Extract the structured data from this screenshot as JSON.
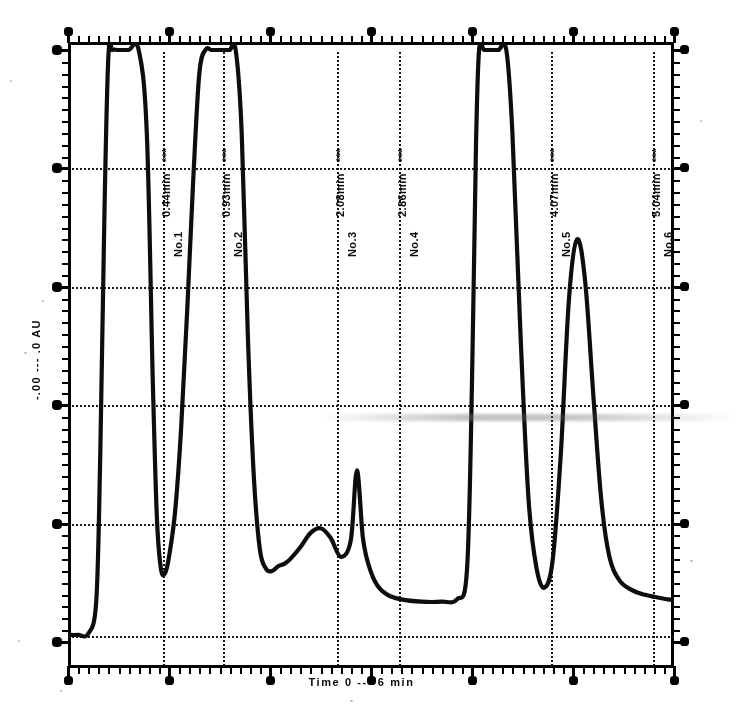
{
  "figure": {
    "title": "",
    "xlabel": "Time  0  ---  6 min",
    "ylabel": "-.00 --- .0 AU"
  },
  "axes": {
    "x_major_ticks": [
      "0",
      "1",
      "2",
      "3",
      "4",
      "5",
      "6"
    ],
    "y_major_ticks": [
      "5",
      "4",
      "3",
      "2",
      "1",
      "0"
    ],
    "grid": "horizontal-dotted",
    "frame": "box"
  },
  "annotations": [
    {
      "no": "No.1",
      "time": "0.44min",
      "extra": "***",
      "x_px": 95,
      "label_x_px": 98
    },
    {
      "no": "No.2",
      "time": "0.93min",
      "extra": "***",
      "x_px": 155,
      "label_x_px": 158
    },
    {
      "no": "No.3",
      "time": "2.08min",
      "extra": "***",
      "x_px": 269,
      "label_x_px": 272
    },
    {
      "no": "No.4",
      "time": "2.86min",
      "extra": "***",
      "x_px": 331,
      "label_x_px": 334
    },
    {
      "no": "No.5",
      "time": "4.07min",
      "extra": "***",
      "x_px": 483,
      "label_x_px": 486
    },
    {
      "no": "No.6",
      "time": "5.04min",
      "extra": "***",
      "x_px": 585,
      "label_x_px": 588
    }
  ],
  "chart_data": {
    "type": "line",
    "title": "",
    "xlabel": "Time  0  ---  6 min",
    "ylabel": "-.00 --- .0 AU",
    "xlim": [
      0,
      6
    ],
    "ylim": [
      0,
      5
    ],
    "grid": true,
    "legend": "none",
    "series": [
      {
        "name": "detector-response",
        "x": [
          0.0,
          0.1,
          0.2,
          0.28,
          0.32,
          0.36,
          0.4,
          0.44,
          0.5,
          0.6,
          0.7,
          0.78,
          0.84,
          0.88,
          0.92,
          0.96,
          1.0,
          1.06,
          1.12,
          1.18,
          1.24,
          1.3,
          1.36,
          1.42,
          1.48,
          1.54,
          1.6,
          1.66,
          1.72,
          1.78,
          1.84,
          1.9,
          1.96,
          2.02,
          2.08,
          2.14,
          2.2,
          2.3,
          2.4,
          2.5,
          2.6,
          2.7,
          2.8,
          2.86,
          2.92,
          2.98,
          3.06,
          3.16,
          3.3,
          3.5,
          3.7,
          3.85,
          3.95,
          4.0,
          4.04,
          4.07,
          4.12,
          4.18,
          4.26,
          4.34,
          4.4,
          4.48,
          4.56,
          4.64,
          4.72,
          4.8,
          4.88,
          4.96,
          5.04,
          5.12,
          5.2,
          5.28,
          5.36,
          5.46,
          5.58,
          5.7,
          5.82,
          5.94,
          6.0
        ],
        "y": [
          0.06,
          0.06,
          0.07,
          0.35,
          1.6,
          3.6,
          4.95,
          5.0,
          5.0,
          5.0,
          5.0,
          4.3,
          2.2,
          1.05,
          0.62,
          0.58,
          0.72,
          1.1,
          1.8,
          2.8,
          3.9,
          4.8,
          5.0,
          5.0,
          5.0,
          5.0,
          5.0,
          5.0,
          4.3,
          2.6,
          1.4,
          0.78,
          0.62,
          0.6,
          0.64,
          0.66,
          0.7,
          0.8,
          0.92,
          0.96,
          0.88,
          0.72,
          0.86,
          1.45,
          0.88,
          0.64,
          0.48,
          0.4,
          0.36,
          0.34,
          0.34,
          0.36,
          0.6,
          2.2,
          4.2,
          5.0,
          5.0,
          5.0,
          5.0,
          5.0,
          4.3,
          2.6,
          1.2,
          0.62,
          0.46,
          0.7,
          1.6,
          2.9,
          3.4,
          3.05,
          2.1,
          1.2,
          0.72,
          0.52,
          0.44,
          0.4,
          0.38,
          0.36,
          0.36
        ]
      }
    ]
  }
}
